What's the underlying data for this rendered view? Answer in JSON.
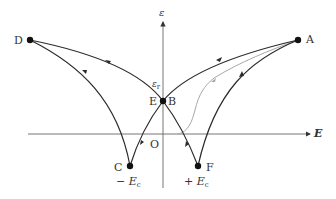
{
  "diagram": {
    "type": "butterfly-strain-field-curve",
    "axes": {
      "x_label": "E",
      "y_label": "ε",
      "origin_label": "O"
    },
    "points": {
      "A": "A",
      "B": "B",
      "C": "C",
      "D": "D",
      "E": "E",
      "F": "F"
    },
    "annotations": {
      "remanent_strain": "ε",
      "remanent_strain_sub": "r",
      "neg_coercive_prefix": "− ",
      "neg_coercive": "E",
      "neg_coercive_sub": "c",
      "pos_coercive_prefix": "+ ",
      "pos_coercive": "E",
      "pos_coercive_sub": "c"
    },
    "colors": {
      "curve": "#2a2a2a",
      "initial_curve": "#a0a0a0",
      "axis": "#555555"
    }
  }
}
